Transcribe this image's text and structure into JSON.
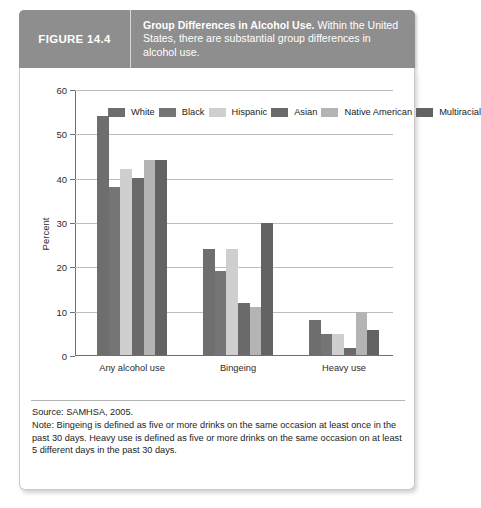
{
  "header": {
    "figure_label": "FIGURE 14.4",
    "caption_bold": "Group Differences in Alcohol Use.",
    "caption_rest": " Within the United States, there are substantial group differences in alcohol use.",
    "band_color": "#8e8e8e"
  },
  "footnote": {
    "source": "Source: SAMHSA, 2005.",
    "note": "Note: Bingeing is defined as five or more drinks on the same occasion at least once in the past 30 days. Heavy use is defined as five or more drinks on the same occasion on at least 5 different days in the past 30 days."
  },
  "chart_data": {
    "type": "bar",
    "title": "Group Differences in Alcohol Use",
    "xlabel": "",
    "ylabel": "Percent",
    "ylim": [
      0,
      60
    ],
    "yticks": [
      0,
      10,
      20,
      30,
      40,
      50,
      60
    ],
    "grid": true,
    "legend_position": "top-inside",
    "categories": [
      "Any alcohol use",
      "Bingeing",
      "Heavy use"
    ],
    "series": [
      {
        "name": "White",
        "color": "#6e6e6e",
        "values": [
          54,
          24,
          8
        ]
      },
      {
        "name": "Black",
        "color": "#757575",
        "values": [
          38,
          19,
          4.7
        ]
      },
      {
        "name": "Hispanic",
        "color": "#cfcfcf",
        "values": [
          42,
          24,
          4.7
        ]
      },
      {
        "name": "Asian",
        "color": "#6a6a6a",
        "values": [
          40,
          11.8,
          1.5
        ]
      },
      {
        "name": "Native American",
        "color": "#b4b4b4",
        "values": [
          44,
          10.8,
          9.8
        ]
      },
      {
        "name": "Multiracial",
        "color": "#636363",
        "values": [
          44,
          29.8,
          5.6
        ]
      }
    ]
  }
}
